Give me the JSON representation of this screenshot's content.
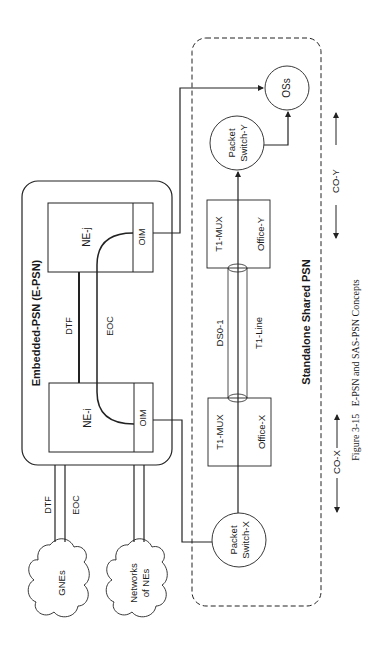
{
  "diagram": {
    "orientation": "rotated-90-ccw",
    "caption": "Figure 3-15   E-PSN and SAS-PSN Concepts",
    "embedded_psn": {
      "title": "Embedded-PSN (E-PSN)",
      "ne_j": {
        "label": "NE-j",
        "port": "OIM"
      },
      "ne_i": {
        "label": "NE-i",
        "port": "OIM"
      },
      "link_dtf": "DTF",
      "link_eoc": "EOC"
    },
    "external": {
      "dtf_label": "DTF",
      "eoc_label": "EOC",
      "cloud_gnes": "GNEs",
      "cloud_networks_line1": "Networks",
      "cloud_networks_line2": "of NEs"
    },
    "standalone_psn": {
      "title": "Standalone Shared PSN",
      "packet_switch_x_line1": "Packet",
      "packet_switch_x_line2": "Switch-X",
      "packet_switch_y_line1": "Packet",
      "packet_switch_y_line2": "Switch-Y",
      "oss": "OSs",
      "mux_x": {
        "label": "T1-MUX",
        "office": "Office-X"
      },
      "mux_y": {
        "label": "T1-MUX",
        "office": "Office-Y"
      },
      "ds0_label": "DS0-1",
      "t1_label": "T1-Line"
    },
    "offices": {
      "co_x": "CO-X",
      "co_y": "CO-Y"
    }
  }
}
